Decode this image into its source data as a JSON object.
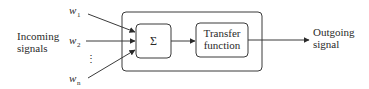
{
  "diagram": {
    "type": "neuron-model-block-diagram",
    "inputs": {
      "label_line1": "Incoming",
      "label_line2": "signals",
      "weights": [
        {
          "symbol": "w",
          "subscript": "1"
        },
        {
          "symbol": "w",
          "subscript": "2"
        },
        {
          "symbol": "w",
          "subscript": "n"
        }
      ],
      "ellipsis": "⋮"
    },
    "blocks": {
      "summation": {
        "label": "Σ"
      },
      "transfer": {
        "label_line1": "Transfer",
        "label_line2": "function"
      }
    },
    "output": {
      "label_line1": "Outgoing",
      "label_line2": "signal"
    },
    "colors": {
      "stroke": "#3a3a3a",
      "text": "#2a2a2a",
      "background": "#ffffff"
    }
  }
}
